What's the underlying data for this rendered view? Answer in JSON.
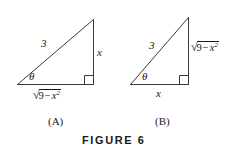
{
  "figure": {
    "caption": "FIGURE 6",
    "stroke_color": "#3a3a3a",
    "text_color": "#1a1a1a",
    "background_color": "#ffffff"
  },
  "panels": [
    {
      "label": "(A)",
      "hypotenuse_label": "3",
      "vertical_leg_label": "x",
      "base_radical": {
        "surd": "√",
        "number": "9",
        "operator": "−",
        "variable": "x",
        "exponent": "2"
      },
      "angle_label": "θ",
      "right_angle_marker": "right-angle-square"
    },
    {
      "label": "(B)",
      "hypotenuse_label": "3",
      "base_label": "x",
      "vertical_radical": {
        "surd": "√",
        "number": "9",
        "operator": "−",
        "variable": "x",
        "exponent": "2"
      },
      "angle_label": "θ",
      "right_angle_marker": "right-angle-square"
    }
  ]
}
